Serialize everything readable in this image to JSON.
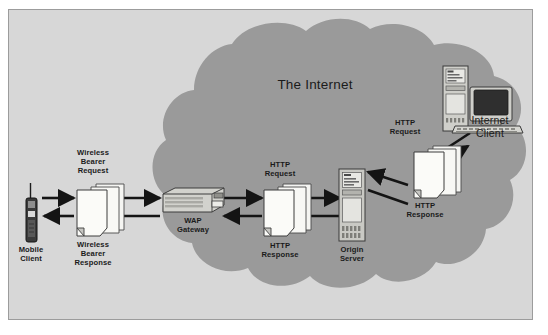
{
  "diagram": {
    "title_in_cloud": "The Internet",
    "background_color": "#d7d7d7",
    "cloud_color": "#9a9a9a",
    "document_color": "#f5f5f2",
    "arrow_color": "#141414",
    "border_color": "#9c9c9c",
    "nodes": [
      {
        "id": "mobile-client",
        "label": "Mobile\nClient",
        "icon": "mobile-phone-icon"
      },
      {
        "id": "wap-gateway",
        "label": "WAP\nGateway",
        "icon": "gateway-router-icon"
      },
      {
        "id": "origin-server",
        "label": "Origin\nServer",
        "icon": "server-tower-icon"
      },
      {
        "id": "internet-client",
        "label": "Internet\nClient",
        "icon": "desktop-computer-icon"
      }
    ],
    "message_stacks": [
      {
        "id": "wireless-bearer",
        "top_label": "Wireless\nBearer\nRequest",
        "bottom_label": "Wireless\nBearer\nResponse",
        "icon": "document-stack-icon"
      },
      {
        "id": "http-gateway-origin",
        "top_label": "HTTP\nRequest",
        "bottom_label": "HTTP\nResponse",
        "icon": "document-stack-icon"
      },
      {
        "id": "http-origin-client",
        "top_label": "HTTP\nRequest",
        "bottom_label": "HTTP\nResponse",
        "icon": "document-stack-icon"
      }
    ],
    "flows": [
      {
        "from": "mobile-client",
        "to": "wap-gateway",
        "direction": "right",
        "message": "Wireless Bearer Request"
      },
      {
        "from": "wap-gateway",
        "to": "mobile-client",
        "direction": "left",
        "message": "Wireless Bearer Response"
      },
      {
        "from": "wap-gateway",
        "to": "origin-server",
        "direction": "right",
        "message": "HTTP Request"
      },
      {
        "from": "origin-server",
        "to": "wap-gateway",
        "direction": "left",
        "message": "HTTP Response"
      },
      {
        "from": "internet-client",
        "to": "origin-server",
        "direction": "left",
        "message": "HTTP Request"
      },
      {
        "from": "origin-server",
        "to": "internet-client",
        "direction": "right",
        "message": "HTTP Response"
      }
    ]
  }
}
